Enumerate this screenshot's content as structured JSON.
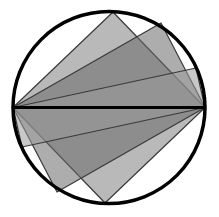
{
  "diagram": {
    "circle": {
      "cx": 109,
      "cy": 107.5,
      "r": 96,
      "stroke": "#000000",
      "stroke_width": 3.5
    },
    "diameter": {
      "x1": 13,
      "y1": 107.5,
      "x2": 205,
      "y2": 107.5,
      "stroke": "#000000",
      "stroke_width": 3
    },
    "rectangles": [
      {
        "name": "rectangle-steep",
        "points": [
          [
            13,
            107.5
          ],
          [
            113,
            12
          ],
          [
            205,
            107.5
          ],
          [
            105,
            203
          ]
        ],
        "fill": "#808080",
        "opacity": 0.55
      },
      {
        "name": "rectangle-medium",
        "points": [
          [
            13,
            107.5
          ],
          [
            161,
            23
          ],
          [
            205,
            107.5
          ],
          [
            57,
            192
          ]
        ],
        "fill": "#6a6a6a",
        "opacity": 0.55
      },
      {
        "name": "rectangle-shallow",
        "points": [
          [
            13,
            107.5
          ],
          [
            196,
            68
          ],
          [
            205,
            107.5
          ],
          [
            22,
            147
          ]
        ],
        "fill": "#9a9a9a",
        "opacity": 0.55
      }
    ],
    "edge_stroke": "#3a3a3a"
  }
}
